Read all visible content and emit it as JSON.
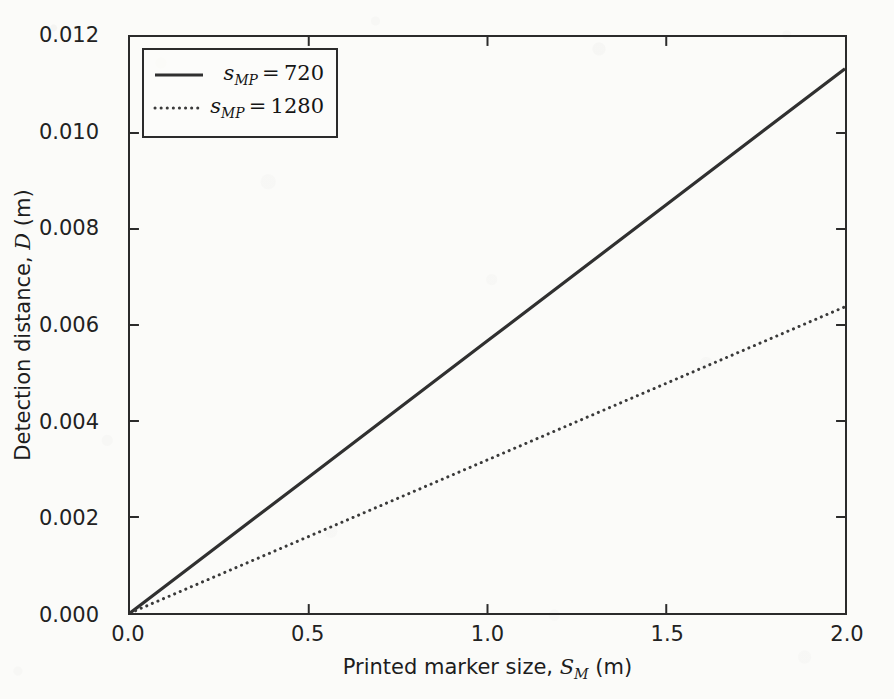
{
  "chart_data": {
    "type": "line",
    "title": "",
    "xlabel": "Printed marker size, S_M (m)",
    "ylabel": "Detection distance, D (m)",
    "xlabel_parts": {
      "prefix": "Printed marker size, ",
      "symbol": "S",
      "subscript": "M",
      "suffix": " (m)"
    },
    "ylabel_parts": {
      "prefix": "Detection distance, ",
      "symbol": "D",
      "subscript": "",
      "suffix": " (m)"
    },
    "xlim": [
      0.0,
      2.0
    ],
    "ylim": [
      0.0,
      0.012
    ],
    "xticks": [
      0.0,
      0.5,
      1.0,
      1.5,
      2.0
    ],
    "yticks": [
      0.0,
      0.002,
      0.004,
      0.006,
      0.008,
      0.01,
      0.012
    ],
    "xtick_labels": [
      "0.0",
      "0.5",
      "1.0",
      "1.5",
      "2.0"
    ],
    "ytick_labels": [
      "0.000",
      "0.002",
      "0.004",
      "0.006",
      "0.008",
      "0.010",
      "0.012"
    ],
    "grid": false,
    "legend_position": "upper left",
    "x": [
      0.0,
      0.5,
      1.0,
      1.5,
      2.0
    ],
    "series": [
      {
        "name": "s_MP = 720",
        "name_parts": {
          "symbol": "s",
          "subscript": "MP",
          "value": "720"
        },
        "style": "solid",
        "color": "#303030",
        "linewidth": 3.2,
        "slope": 0.00567,
        "values": [
          0.0,
          0.002835,
          0.00567,
          0.008505,
          0.01134
        ]
      },
      {
        "name": "s_MP = 1280",
        "name_parts": {
          "symbol": "s",
          "subscript": "MP",
          "value": "1280"
        },
        "style": "dotted",
        "color": "#3a3a3a",
        "linewidth": 3.0,
        "slope": 0.00319,
        "values": [
          0.0,
          0.001595,
          0.00319,
          0.004785,
          0.00638
        ]
      }
    ]
  },
  "axes": {
    "frame_color": "#2b2b2b",
    "tick_direction": "in",
    "background": "#fbfbf9"
  },
  "legend": {
    "rows": [
      {
        "label_symbol": "s",
        "label_subscript": "MP",
        "label_value": "720",
        "style": "solid"
      },
      {
        "label_symbol": "s",
        "label_subscript": "MP",
        "label_value": "1280",
        "style": "dotted"
      }
    ]
  }
}
